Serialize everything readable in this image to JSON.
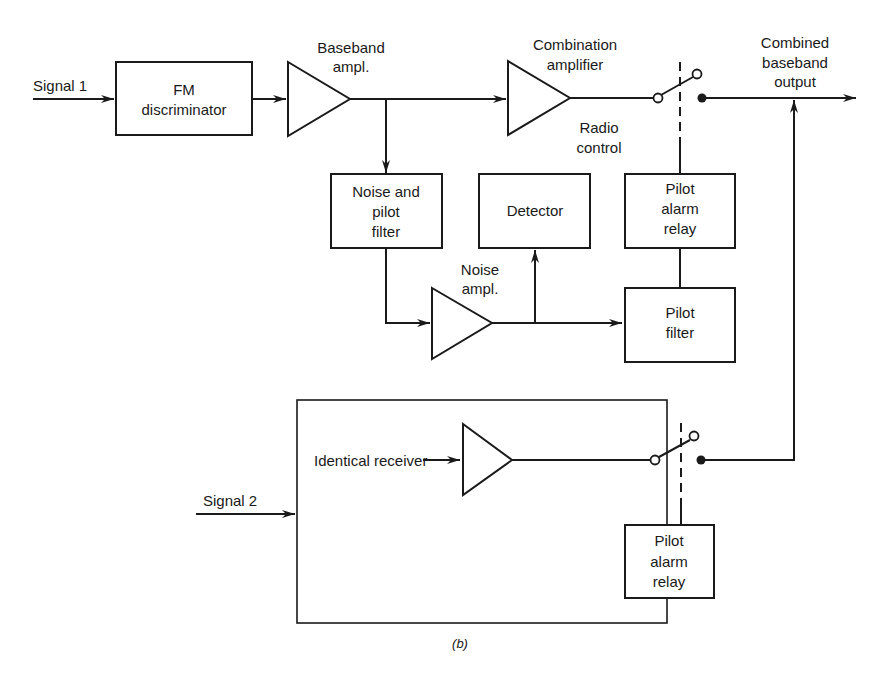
{
  "diagram": {
    "type": "block-diagram",
    "caption": "(b)",
    "colors": {
      "line": "#1a1a1a",
      "background": "#ffffff"
    }
  },
  "inputs": {
    "signal1": "Signal 1",
    "signal2": "Signal 2"
  },
  "blocks": {
    "fm_discriminator": [
      "FM",
      "discriminator"
    ],
    "noise_pilot_filter": [
      "Noise and",
      "pilot",
      "filter"
    ],
    "detector": [
      "Detector"
    ],
    "pilot_alarm_relay_1": [
      "Pilot",
      "alarm",
      "relay"
    ],
    "pilot_filter": [
      "Pilot",
      "filter"
    ],
    "pilot_alarm_relay_2": [
      "Pilot",
      "alarm",
      "relay"
    ]
  },
  "amplifiers": {
    "baseband_ampl": [
      "Baseband",
      "ampl."
    ],
    "combination_amplifier": [
      "Combination",
      "amplifier"
    ],
    "noise_ampl": [
      "Noise",
      "ampl."
    ]
  },
  "labels": {
    "radio_control": [
      "Radio",
      "control"
    ],
    "combined_output": [
      "Combined",
      "baseband",
      "output"
    ],
    "identical_receiver": "Identical receiver"
  },
  "edges": [
    {
      "from": "signal1",
      "to": "fm_discriminator"
    },
    {
      "from": "fm_discriminator",
      "to": "baseband_ampl"
    },
    {
      "from": "baseband_ampl",
      "to": "combination_amplifier"
    },
    {
      "from": "baseband_ampl",
      "to": "noise_pilot_filter"
    },
    {
      "from": "noise_pilot_filter",
      "to": "noise_ampl"
    },
    {
      "from": "noise_ampl",
      "to": "detector"
    },
    {
      "from": "noise_ampl",
      "to": "pilot_filter"
    },
    {
      "from": "pilot_filter",
      "to": "pilot_alarm_relay_1"
    },
    {
      "from": "pilot_alarm_relay_1",
      "to": "switch_1",
      "style": "dashed-mechanical"
    },
    {
      "from": "combination_amplifier",
      "to": "switch_1"
    },
    {
      "from": "switch_1",
      "to": "combined_output"
    },
    {
      "from": "signal2",
      "to": "identical_receiver_box"
    },
    {
      "from": "identical_receiver",
      "to": "receiver_2_amp"
    },
    {
      "from": "receiver_2_amp",
      "to": "switch_2"
    },
    {
      "from": "pilot_alarm_relay_2",
      "to": "switch_2",
      "style": "dashed-mechanical"
    },
    {
      "from": "switch_2",
      "to": "combined_output"
    }
  ]
}
